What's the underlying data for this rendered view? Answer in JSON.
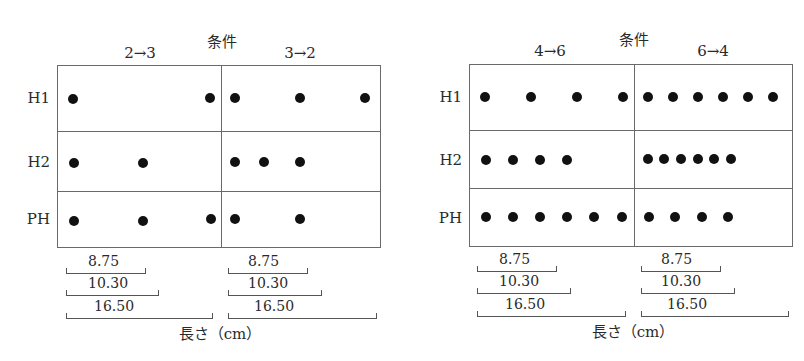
{
  "panels": [
    {
      "condition_title": "条件",
      "columns": [
        {
          "label": "2→3"
        },
        {
          "label": "3→2"
        }
      ],
      "rows": [
        {
          "label": "H1"
        },
        {
          "label": "H2"
        },
        {
          "label": "PH"
        }
      ],
      "axis_label": "長さ（cm）",
      "scale_brackets": [
        {
          "value": "8.75"
        },
        {
          "value": "10.30"
        },
        {
          "value": "16.50"
        }
      ],
      "dots": {
        "H1": {
          "2→3": 2,
          "3→2": 3
        },
        "H2": {
          "2→3": 2,
          "3→2": 3
        },
        "PH": {
          "2→3": 3,
          "3→2": 2
        }
      }
    },
    {
      "condition_title": "条件",
      "columns": [
        {
          "label": "4→6"
        },
        {
          "label": "6→4"
        }
      ],
      "rows": [
        {
          "label": "H1"
        },
        {
          "label": "H2"
        },
        {
          "label": "PH"
        }
      ],
      "axis_label": "長さ（cm）",
      "scale_brackets": [
        {
          "value": "8.75"
        },
        {
          "value": "10.30"
        },
        {
          "value": "16.50"
        }
      ],
      "dots": {
        "H1": {
          "4→6": 4,
          "6→4": 6
        },
        "H2": {
          "4→6": 4,
          "6→4": 6
        },
        "PH": {
          "4→6": 6,
          "6→4": 4
        }
      }
    }
  ]
}
